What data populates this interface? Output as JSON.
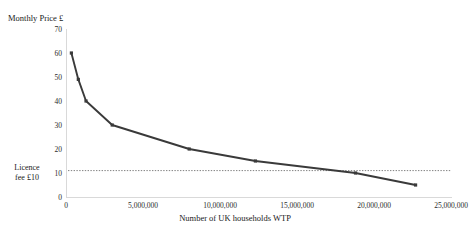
{
  "chart_data": {
    "type": "line",
    "title": "",
    "xlabel": "Number of UK households WTP",
    "ylabel": "Monthly Price £",
    "xlim": [
      0,
      25000000
    ],
    "ylim": [
      0,
      70
    ],
    "grid": false,
    "legend": "none",
    "x_ticks": [
      "0",
      "5,000,000",
      "10,000,000",
      "15,000,000",
      "20,000,000",
      "25,000,000"
    ],
    "x_tick_values": [
      0,
      5000000,
      10000000,
      15000000,
      20000000,
      25000000
    ],
    "y_ticks": [
      "0",
      "10",
      "20",
      "30",
      "40",
      "50",
      "60",
      "70"
    ],
    "y_tick_values": [
      0,
      10,
      20,
      30,
      40,
      50,
      60,
      70
    ],
    "series": [
      {
        "name": "Demand curve",
        "color": "#3a3a3a",
        "marker": "square",
        "x": [
          350000,
          800000,
          1300000,
          3000000,
          8000000,
          12300000,
          18800000,
          22700000
        ],
        "values": [
          60,
          49,
          40,
          30,
          20,
          15,
          10,
          5
        ]
      }
    ],
    "annotations": [
      {
        "name": "licence-fee-reference",
        "label_line1": "Licence",
        "label_line2": "fee £10",
        "type": "horizontal-dotted-line",
        "y_value": 11,
        "color": "#808080"
      }
    ]
  },
  "axis": {
    "y_title": "Monthly Price £",
    "x_title": "Number of UK households WTP"
  },
  "reference": {
    "label_line1": "Licence",
    "label_line2": "fee £10"
  }
}
